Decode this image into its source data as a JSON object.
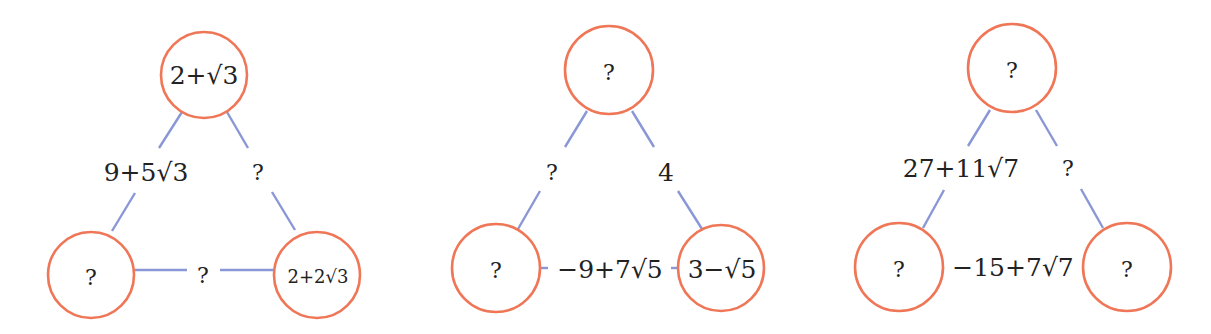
{
  "colors": {
    "node_stroke": "#ef7656",
    "edge_stroke": "#8a97d6",
    "text": "#222222",
    "background": "#ffffff"
  },
  "diagrams": [
    {
      "nodes": {
        "top": "2+√3",
        "bottom_left": "?",
        "bottom_right": "2+2√3"
      },
      "edges": {
        "left": "9+5√3",
        "right": "?",
        "bottom": "?"
      }
    },
    {
      "nodes": {
        "top": "?",
        "bottom_left": "?",
        "bottom_right": "3−√5"
      },
      "edges": {
        "left": "?",
        "right": "4",
        "bottom": "−9+7√5"
      }
    },
    {
      "nodes": {
        "top": "?",
        "bottom_left": "?",
        "bottom_right": "?"
      },
      "edges": {
        "left": "27+11√7",
        "right": "?",
        "bottom": "−15+7√7"
      }
    }
  ]
}
